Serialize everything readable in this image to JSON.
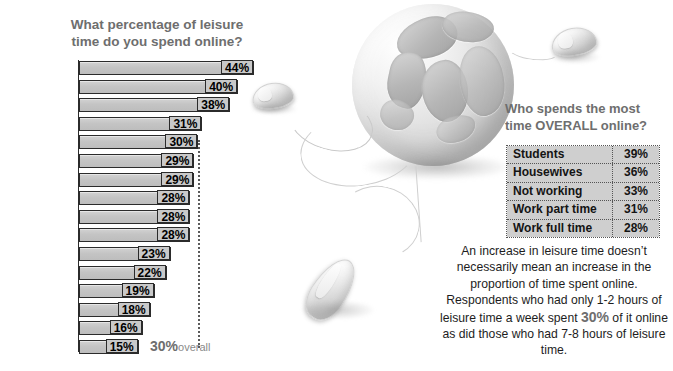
{
  "chart_data": {
    "type": "bar",
    "title": "What percentage of leisure time do you spend online?",
    "orientation": "horizontal",
    "xlabel": "",
    "ylabel": "",
    "xlim": [
      0,
      44
    ],
    "grid": false,
    "categories": [
      "China",
      "Korea",
      "Japan",
      "Italy",
      "USA",
      "Spain",
      "Australia",
      "Canada",
      "France",
      "UK",
      "Germany",
      "Norway",
      "Netherlands",
      "Sweden",
      "Finland",
      "Denmark"
    ],
    "values": [
      44,
      40,
      38,
      31,
      30,
      29,
      29,
      28,
      28,
      28,
      23,
      22,
      19,
      18,
      16,
      15
    ],
    "value_labels": [
      "44%",
      "40%",
      "38%",
      "31%",
      "30%",
      "29%",
      "29%",
      "28%",
      "28%",
      "28%",
      "23%",
      "22%",
      "19%",
      "18%",
      "16%",
      "15%"
    ],
    "highlight_category": "UK",
    "reference_line": {
      "value": 30,
      "label": "30%",
      "label_suffix": "overall",
      "style": "dotted"
    },
    "bar_fill": "#c6c6c6",
    "bar_border": "#2b2b2b"
  },
  "chart": {
    "title_line1": "What percentage of leisure",
    "title_line2": "time do you spend online?",
    "overall_value": "30%",
    "overall_suffix": "overall"
  },
  "panel": {
    "title_line1": "Who spends the most",
    "title_line2": "time OVERALL online?",
    "table": {
      "rows": [
        {
          "label": "Students",
          "value": "39%"
        },
        {
          "label": "Housewives",
          "value": "36%"
        },
        {
          "label": "Not working",
          "value": "33%"
        },
        {
          "label": "Work part time",
          "value": "31%"
        },
        {
          "label": "Work full time",
          "value": "28%"
        }
      ]
    },
    "paragraph": {
      "line1": "An increase in leisure time doesn’t",
      "line2": "necessarily mean an increase in the",
      "line3": "proportion of time spent online.",
      "line4": "Respondents who had only 1-2",
      "line5": "hours of leisure time a week spent",
      "line6_highlight": "30%",
      "line6_rest": " of it online as did those who",
      "line7": "had 7-8 hours of leisure time."
    }
  },
  "imagery": {
    "globe": "globe-image",
    "mouse_top_right": "computer-mouse-image",
    "mouse_top_left": "computer-mouse-image",
    "mouse_bottom_center": "computer-mouse-image"
  },
  "colors": {
    "title_gray": "#6e6e6e",
    "bar_fill": "#c6c6c6",
    "bar_outline": "#2b2b2b",
    "table_cell": "#cfcfcf",
    "text_black": "#1d1d1d"
  }
}
